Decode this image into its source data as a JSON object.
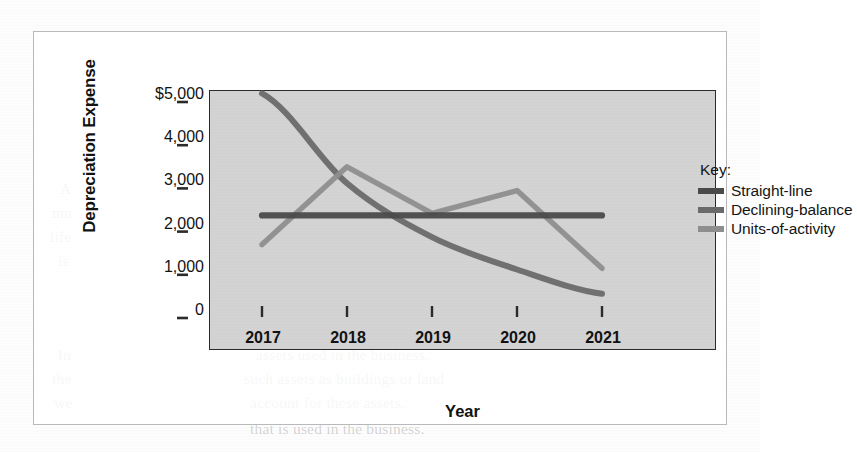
{
  "figure": {
    "panel_background": "#d3d3d3",
    "frame_color": "#b9b9bd",
    "axis_color": "#2b2b2b"
  },
  "legend": {
    "title": "Key:",
    "position": "inside-top-right",
    "entries": [
      {
        "label": "Straight-line",
        "color": "#4a4a4a"
      },
      {
        "label": "Declining-balance",
        "color": "#6a6a6a"
      },
      {
        "label": "Units-of-activity",
        "color": "#8e8e8e"
      }
    ]
  },
  "axes": {
    "x_title": "Year",
    "y_title": "Depreciation Expense",
    "x_tick_labels": [
      "2017",
      "2018",
      "2019",
      "2020",
      "2021"
    ],
    "y_tick_labels": [
      "$5,000",
      "4,000",
      "3,000",
      "2,000",
      "1,000",
      "0"
    ]
  },
  "page_background_text": [
    {
      "text": "that the book value of the asset is",
      "x": 250,
      "y": 152
    },
    {
      "text": "revised depreciation is calculated",
      "x": 248,
      "y": 176
    },
    {
      "text": "over the asset's remaining useful",
      "x": 250,
      "y": 200
    },
    {
      "text": "change in accounting estimate",
      "x": 252,
      "y": 224
    },
    {
      "text": "of prior periods are changed.",
      "x": 254,
      "y": 248
    },
    {
      "text": "assets used in the business.",
      "x": 256,
      "y": 346
    },
    {
      "text": "such assets as buildings or land",
      "x": 244,
      "y": 370
    },
    {
      "text": "account for these assets.",
      "x": 250,
      "y": 394
    },
    {
      "text": "that is used in the business.",
      "x": 250,
      "y": 420
    },
    {
      "text": "A",
      "x": 60,
      "y": 180
    },
    {
      "text": "mu",
      "x": 52,
      "y": 204
    },
    {
      "text": "life",
      "x": 50,
      "y": 228
    },
    {
      "text": "is",
      "x": 58,
      "y": 252
    },
    {
      "text": "In",
      "x": 58,
      "y": 346
    },
    {
      "text": "the",
      "x": 52,
      "y": 370
    },
    {
      "text": "we",
      "x": 54,
      "y": 394
    }
  ],
  "chart_data": {
    "type": "line",
    "title": "",
    "xlabel": "Year",
    "ylabel": "Depreciation Expense",
    "categories": [
      "2017",
      "2018",
      "2019",
      "2020",
      "2021"
    ],
    "xlim": [
      "2017",
      "2021"
    ],
    "ylim": [
      0,
      5600
    ],
    "y_ticks": [
      0,
      1000,
      2000,
      3000,
      4000,
      5000
    ],
    "grid": false,
    "legend_position": "inside-top-right",
    "series": [
      {
        "name": "Straight-line",
        "color": "#4a4a4a",
        "values": [
          2375,
          2375,
          2375,
          2375,
          2375
        ]
      },
      {
        "name": "Declining-balance",
        "color": "#6a6a6a",
        "values": [
          5200,
          3120,
          1872,
          1123,
          560
        ]
      },
      {
        "name": "Units-of-activity",
        "color": "#8e8e8e",
        "values": [
          1700,
          3500,
          2420,
          2950,
          1150
        ]
      }
    ]
  }
}
